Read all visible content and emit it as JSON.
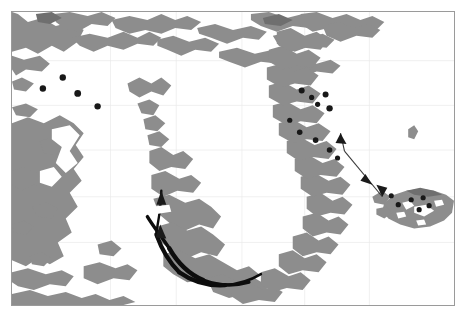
{
  "figure": {
    "type": "map",
    "title": "",
    "region": "North Atlantic / Greenland",
    "frame": {
      "border_color": "#9a9a9a",
      "background": "#ffffff"
    },
    "colors": {
      "land": "#8d8d8d",
      "land_shadow": "#6f6f6f",
      "ice_cap": "#ffffff",
      "marker": "#181818",
      "track": "#0d0d0d",
      "arrow": "#3a3a3a",
      "graticule": "#e9e9e9"
    },
    "graticule": {
      "visible": true,
      "meridian_x": [
        110,
        176,
        242,
        305,
        370
      ],
      "parallel_y": [
        60,
        105,
        150,
        197,
        243
      ]
    },
    "landmasses": [
      {
        "name": "canadian-arctic-archipelago",
        "label": ""
      },
      {
        "name": "baffin-island",
        "label": ""
      },
      {
        "name": "greenland",
        "label": ""
      },
      {
        "name": "iceland",
        "label": ""
      },
      {
        "name": "jan-mayen",
        "label": ""
      },
      {
        "name": "svalbard-edge",
        "label": ""
      },
      {
        "name": "labrador-coast",
        "label": ""
      }
    ],
    "site_markers": [
      {
        "name": "site-1",
        "x": 62,
        "y": 77
      },
      {
        "name": "site-2",
        "x": 42,
        "y": 88
      },
      {
        "name": "site-3",
        "x": 77,
        "y": 93
      },
      {
        "name": "site-4",
        "x": 97,
        "y": 106
      },
      {
        "name": "site-5",
        "x": 302,
        "y": 90
      },
      {
        "name": "site-6",
        "x": 312,
        "y": 97
      },
      {
        "name": "site-7",
        "x": 326,
        "y": 94
      },
      {
        "name": "site-8",
        "x": 318,
        "y": 104
      },
      {
        "name": "site-9",
        "x": 330,
        "y": 108
      },
      {
        "name": "site-10",
        "x": 290,
        "y": 120
      },
      {
        "name": "site-11",
        "x": 300,
        "y": 132
      },
      {
        "name": "site-12",
        "x": 316,
        "y": 140
      },
      {
        "name": "site-13",
        "x": 330,
        "y": 150
      },
      {
        "name": "site-14",
        "x": 338,
        "y": 158
      },
      {
        "name": "site-15",
        "x": 392,
        "y": 196
      },
      {
        "name": "site-16",
        "x": 399,
        "y": 205
      },
      {
        "name": "site-17",
        "x": 412,
        "y": 200
      },
      {
        "name": "site-18",
        "x": 424,
        "y": 198
      },
      {
        "name": "site-19",
        "x": 420,
        "y": 210
      },
      {
        "name": "site-20",
        "x": 430,
        "y": 206
      }
    ],
    "tracks": [
      {
        "name": "west-greenland-coastal-track",
        "style": "thick-black",
        "description": "Thick black track along the southwest Greenland coast"
      }
    ],
    "arrows": [
      {
        "name": "east-greenland-to-iceland-arrow",
        "from": {
          "x": 345,
          "y": 152
        },
        "to": {
          "x": 382,
          "y": 196
        },
        "style": "thin-line-with-head"
      },
      {
        "name": "greenland-interior-arrow-north",
        "from": {
          "x": 160,
          "y": 225
        },
        "to": {
          "x": 158,
          "y": 196
        },
        "style": "thin-line-with-head"
      },
      {
        "name": "greenland-interior-arrow-south",
        "from": {
          "x": 148,
          "y": 215
        },
        "to": {
          "x": 163,
          "y": 236
        },
        "style": "thin-line-with-head"
      }
    ]
  }
}
